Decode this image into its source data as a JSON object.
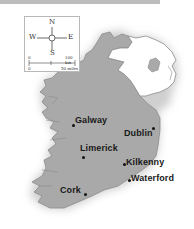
{
  "map": {
    "colors": {
      "republic": "#a9a9a9",
      "northern_ireland": "#ffffff",
      "coast_shadow": "#d9d9d9",
      "border": "#8c8c8c"
    },
    "compass": {
      "north": "N",
      "south": "S",
      "east": "E",
      "west": "W"
    },
    "scale": {
      "km_start": "0",
      "km_end": "100 km",
      "miles_start": "0",
      "miles_end": "50 miles"
    },
    "cities": [
      {
        "name": "Galway"
      },
      {
        "name": "Dublin"
      },
      {
        "name": "Limerick"
      },
      {
        "name": "Kilkenny"
      },
      {
        "name": "Waterford"
      },
      {
        "name": "Cork"
      }
    ]
  }
}
